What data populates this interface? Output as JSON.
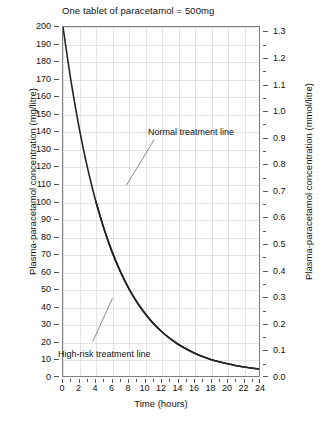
{
  "chart_data": {
    "type": "line",
    "title": "One tablet of paracetamol = 500mg",
    "xlabel": "Time (hours)",
    "ylabel": "Plasma-paracetamol concentration (mg/litre)",
    "ylabel_right": "Plasma-paracetamol concentration (mmol/litre)",
    "xlim": [
      0,
      24
    ],
    "ylim": [
      0,
      200
    ],
    "ylim_right": [
      0.0,
      1.32
    ],
    "grid": true,
    "legend": "none",
    "x_ticks": [
      0,
      2,
      4,
      6,
      8,
      10,
      12,
      14,
      16,
      18,
      20,
      22,
      24
    ],
    "x_tick_labels": [
      "0",
      "2",
      "4",
      "6",
      "8",
      "10",
      "12",
      "14",
      "16",
      "18",
      "20",
      "22",
      "24"
    ],
    "x_minor_step": 1,
    "y_ticks": [
      0,
      10,
      20,
      30,
      40,
      50,
      60,
      70,
      80,
      90,
      100,
      110,
      120,
      130,
      140,
      150,
      160,
      170,
      180,
      190,
      200
    ],
    "y_tick_labels": [
      "0",
      "10",
      "20",
      "30",
      "40",
      "50",
      "60",
      "70",
      "80",
      "90",
      "100",
      "110",
      "120",
      "130",
      "140",
      "150",
      "160",
      "170",
      "180",
      "190",
      "200"
    ],
    "y_ticks_right": [
      0.0,
      0.1,
      0.2,
      0.3,
      0.4,
      0.5,
      0.6,
      0.7,
      0.8,
      0.9,
      1.0,
      1.1,
      1.2,
      1.3
    ],
    "y_tick_labels_right": [
      "0.0",
      "0.1",
      "0.2",
      "0.3",
      "0.4",
      "0.5",
      "0.6",
      "0.7",
      "0.8",
      "0.9",
      "1.0",
      "1.1",
      "1.2",
      "1.3"
    ],
    "y_minor_step_right": 0.05,
    "series": [
      {
        "name": "Normal treatment line",
        "x": [
          0,
          1,
          2,
          3,
          4,
          5,
          6,
          7,
          8,
          9,
          10,
          11,
          12,
          13,
          14,
          15,
          16,
          17,
          18,
          19,
          20,
          21,
          22,
          23,
          24
        ],
        "values": [
          200,
          168.2,
          141.4,
          118.9,
          100,
          84.1,
          70.7,
          59.5,
          50,
          42.0,
          35.4,
          29.7,
          25,
          21.0,
          17.7,
          14.9,
          12.5,
          10.5,
          8.8,
          7.4,
          6.3,
          5.3,
          4.4,
          3.7,
          3.1
        ]
      },
      {
        "name": "High-risk treatment line",
        "x": [
          4,
          5,
          6,
          7,
          8,
          9,
          10,
          11,
          12,
          13,
          14,
          15,
          16,
          17,
          18,
          19,
          20,
          21,
          22,
          23,
          24
        ],
        "values": [
          100,
          84.1,
          70.7,
          59.5,
          50,
          42.0,
          35.4,
          29.7,
          25,
          21.0,
          17.7,
          14.9,
          12.5,
          10.5,
          8.8,
          7.4,
          6.3,
          5.3,
          4.4,
          3.7,
          3.1
        ]
      }
    ],
    "annotations": [
      {
        "text": "Normal treatment line",
        "x": 14.5,
        "y": 118
      },
      {
        "text": "High-risk treatment line",
        "x": 0.6,
        "y": 17
      }
    ]
  }
}
